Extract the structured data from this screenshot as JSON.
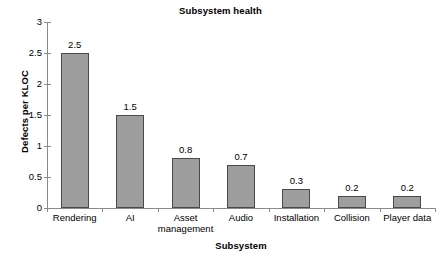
{
  "chart_data": {
    "type": "bar",
    "title": "Subsystem health",
    "xlabel": "Subsystem",
    "ylabel": "Defects per KLOC",
    "categories": [
      "Rendering",
      "AI",
      "Asset\nmanagement",
      "Audio",
      "Installation",
      "Collision",
      "Player data"
    ],
    "values": [
      2.5,
      1.5,
      0.8,
      0.7,
      0.3,
      0.2,
      0.2
    ],
    "value_labels": [
      "2.5",
      "1.5",
      "0.8",
      "0.7",
      "0.3",
      "0.2",
      "0.2"
    ],
    "ylim": [
      0,
      3
    ],
    "yticks": [
      0,
      0.5,
      1,
      1.5,
      2,
      2.5,
      3
    ],
    "ytick_labels": [
      "0",
      "0.5",
      "1",
      "1.5",
      "2",
      "2.5",
      "3"
    ],
    "grid": false,
    "legend": false,
    "bar_color": "#9e9e9e",
    "bar_edge_color": "#4a4a4a",
    "axis_color": "#8a8a8a",
    "text_color": "#000000",
    "background": "#ffffff"
  }
}
